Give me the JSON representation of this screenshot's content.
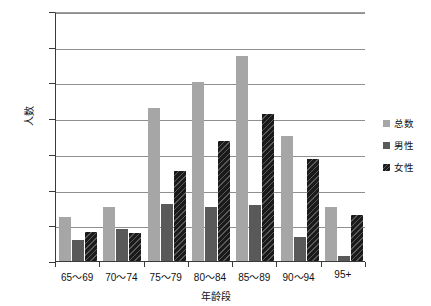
{
  "chart_data": {
    "type": "bar",
    "title": "",
    "xlabel": "年龄段",
    "ylabel": "人数",
    "ylim": [
      0,
      1400
    ],
    "yticks": [
      0,
      200,
      400,
      600,
      800,
      1000,
      1200,
      1400
    ],
    "grid": true,
    "legend_position": "right",
    "categories": [
      "65～69",
      "70～74",
      "75～79",
      "80～84",
      "85～89",
      "90～94",
      "95+"
    ],
    "series": [
      {
        "name": "总数",
        "color": "#a6a6a6",
        "values": [
          245,
          305,
          855,
          1005,
          1150,
          700,
          300
        ]
      },
      {
        "name": "男性",
        "color": "#595959",
        "values": [
          115,
          180,
          320,
          305,
          315,
          135,
          30
        ]
      },
      {
        "name": "女性",
        "color": "#1a1a1a",
        "values": [
          160,
          155,
          505,
          670,
          825,
          570,
          260
        ]
      }
    ]
  },
  "axis": {
    "y_tick_labels": [
      "1400",
      "1200",
      "1000",
      "800",
      "600",
      "400",
      "200",
      "0"
    ],
    "y_label": "人数",
    "x_label": "年龄段"
  },
  "legend": {
    "items": [
      {
        "label": "总数",
        "icon": "legend-swatch-total"
      },
      {
        "label": "男性",
        "icon": "legend-swatch-male"
      },
      {
        "label": "女性",
        "icon": "legend-swatch-female"
      }
    ]
  }
}
